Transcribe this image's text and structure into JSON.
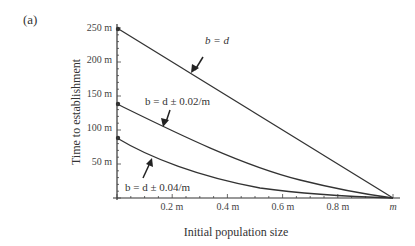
{
  "panel_label": "(a)",
  "chart_data": {
    "type": "line",
    "title": "",
    "xlabel": "Initial population size",
    "ylabel": "Time to establishment",
    "xlim": [
      0,
      1
    ],
    "ylim": [
      0,
      250
    ],
    "x_ticks": [
      "0.2 m",
      "0.4 m",
      "0.6 m",
      "0.8 m",
      "m"
    ],
    "y_ticks": [
      "50 m",
      "100 m",
      "150 m",
      "200 m",
      "250 m"
    ],
    "grid": false,
    "legend": "none (curves annotated with arrows)",
    "x": [
      0,
      0.2,
      0.4,
      0.6,
      0.8,
      1.0
    ],
    "series": [
      {
        "name": "b = d",
        "values": [
          250,
          200,
          150,
          100,
          50,
          0
        ]
      },
      {
        "name": "b = d ± 0.02/m",
        "values": [
          139,
          100,
          68,
          43,
          20,
          0
        ]
      },
      {
        "name": "b = d ± 0.04/m",
        "values": [
          88,
          55,
          34,
          18,
          7,
          0
        ]
      }
    ],
    "annotations": [
      "b = d",
      "b = d ± 0.02/m",
      "b = d ± 0.04/m"
    ]
  },
  "labels": {
    "y_ticks": [
      "50 m",
      "100 m",
      "150 m",
      "200 m",
      "250 m"
    ],
    "x_ticks": [
      "0.2 m",
      "0.4 m",
      "0.6 m",
      "0.8 m",
      "m"
    ],
    "xlabel": "Initial population size",
    "ylabel": "Time to establishment",
    "annot_bd": "b = d",
    "annot_002": "b = d ± 0.02/m",
    "annot_004": "b = d ± 0.04/m"
  }
}
